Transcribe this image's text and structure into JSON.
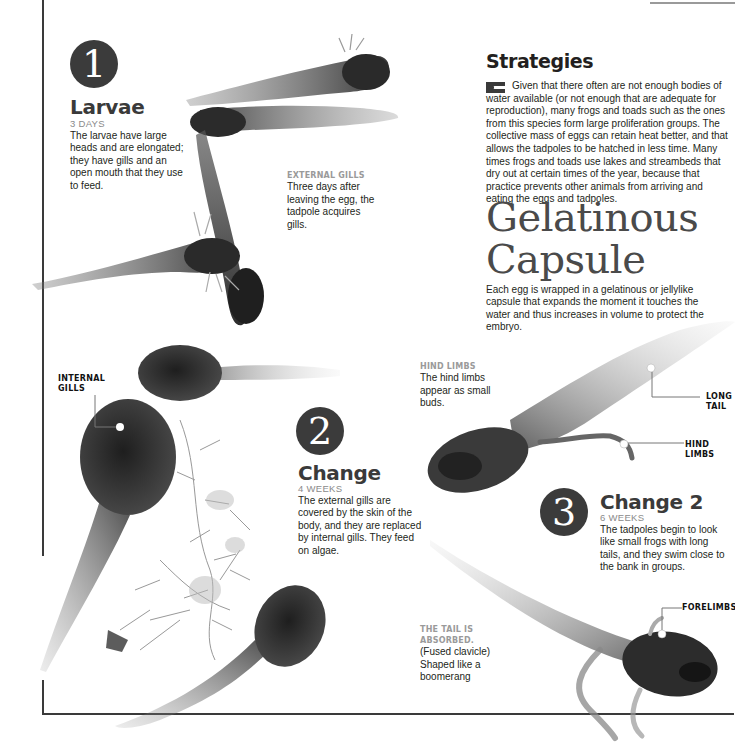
{
  "stages": [
    {
      "number": "1",
      "title": "Larvae",
      "duration": "3 DAYS",
      "description": "The larvae have large heads and are elongated; they have gills and an open mouth that they use to feed."
    },
    {
      "number": "2",
      "title": "Change",
      "duration": "4 WEEKS",
      "description": "The external gills are covered by the skin of the body, and they are replaced by internal gills. They feed on algae."
    },
    {
      "number": "3",
      "title": "Change 2",
      "duration": "6 WEEKS",
      "description": "The tadpoles begin to look like small frogs with long tails, and they swim close to the bank in groups."
    }
  ],
  "annotations": {
    "external_gills": {
      "title": "EXTERNAL GILLS",
      "body": "Three days after leaving the egg, the tadpole acquires gills."
    },
    "hind_limbs": {
      "title": "HIND LIMBS",
      "body": "The hind limbs appear as small buds."
    },
    "tail_absorbed": {
      "title": "THE TAIL IS ABSORBED.",
      "body": "(Fused clavicle) Shaped like a boomerang"
    }
  },
  "callouts": {
    "internal_gills": "INTERNAL GILLS",
    "long_tail": "LONG TAIL",
    "hind_limbs": "HIND LIMBS",
    "forelimbs": "FORELIMBS"
  },
  "strategies": {
    "title": "Strategies",
    "body": "Given that there often are not enough bodies of water available (or not enough that are adequate for reproduction), many frogs and toads such as the ones from this species form large proliferation groups. The collective mass of eggs can retain heat better, and that allows the tadpoles to be hatched in less time. Many times frogs and toads use lakes and streambeds that dry out at certain times of the year, because that practice prevents other animals from arriving and eating the eggs and tadpoles."
  },
  "capsule": {
    "title": "Gelatinous Capsule",
    "body": "Each egg is wrapped in a gelatinous or jellylike capsule that expands the moment it touches the water and thus increases in volume to protect the embryo."
  },
  "colors": {
    "circle": "#3b3b3b",
    "heading": "#3a3a3a",
    "subheading": "#8a8a8a",
    "body_text": "#231f20",
    "frame_line": "#3a3a3a"
  }
}
